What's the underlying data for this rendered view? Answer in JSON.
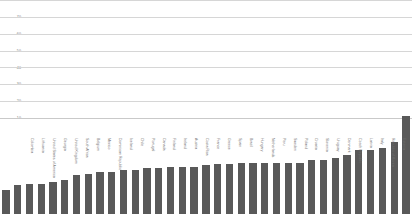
{
  "chart_data": {
    "type": "bar",
    "title": "",
    "subtitle": "",
    "xlabel": "",
    "ylabel": "",
    "ylim": [
      0,
      70
    ],
    "yticks": [
      70,
      60,
      50,
      40,
      30,
      20,
      10
    ],
    "grid": true,
    "legend": false,
    "bar_color": "#595959",
    "gridline_color": "#d6d6d6",
    "axis_text_color": "#7a7a7a",
    "categories": [
      "Colombia",
      "Lithuania",
      "United States of America",
      "Georgia",
      "United Kingdom",
      "South Africa",
      "Belgium",
      "Mexico",
      "Dominican Republic",
      "Iceland",
      "Chile",
      "Portugal",
      "Canada",
      "Finland",
      "Ireland",
      "Austria",
      "Costa Rica",
      "France",
      "Greece",
      "Spain",
      "Brazil",
      "Hungary",
      "Netherlands",
      "Peru",
      "Sweden",
      "Poland",
      "Croatia",
      "Slovenia",
      "Uruguay",
      "Denmark",
      "Czech Republic",
      "Latvia",
      "Italy",
      "Republic of Korea",
      "Estonia"
    ],
    "values": [
      14,
      17,
      18,
      18,
      19,
      20,
      23,
      23.5,
      25,
      25,
      26,
      26,
      27.5,
      27.5,
      28,
      28,
      28,
      29,
      29.5,
      29.5,
      30,
      30,
      30,
      30,
      30,
      30,
      32,
      32,
      33,
      35,
      38,
      38,
      39,
      43,
      58
    ]
  }
}
